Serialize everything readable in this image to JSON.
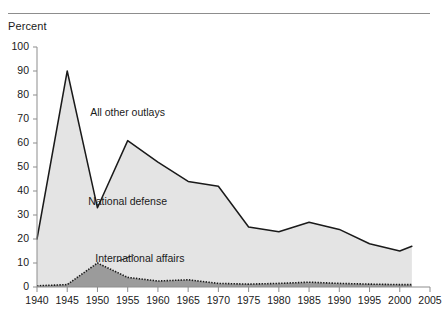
{
  "figure": {
    "y_axis_title": "Percent",
    "partial_top_caption": "",
    "colors": {
      "all_other_fill": "#e4e4e4",
      "international_fill": "#9b9b9b",
      "line": "#1a1a1a",
      "axis": "#8d8d8d",
      "text": "#1a1a1a"
    }
  },
  "chart_data": {
    "type": "area",
    "title": "",
    "subtitle": "",
    "xlabel": "",
    "ylabel": "Percent",
    "xlim": [
      1940,
      2005
    ],
    "ylim": [
      0,
      100
    ],
    "grid": false,
    "legend_position": "inline-annotations",
    "x_ticks": [
      1940,
      1945,
      1950,
      1955,
      1960,
      1965,
      1970,
      1975,
      1980,
      1985,
      1990,
      1995,
      2000,
      2005
    ],
    "y_ticks": [
      0,
      10,
      20,
      30,
      40,
      50,
      60,
      70,
      80,
      90,
      100
    ],
    "annotations": [
      {
        "text": "All other outlays",
        "x": 1955,
        "y": 73
      },
      {
        "text": "National defense",
        "x": 1955,
        "y": 36
      },
      {
        "text": "International affairs",
        "x": 1957,
        "y": 12
      }
    ],
    "x": [
      1940,
      1945,
      1950,
      1955,
      1960,
      1965,
      1970,
      1975,
      1980,
      1985,
      1990,
      1995,
      2000,
      2002
    ],
    "series": [
      {
        "name": "All other outlays",
        "note": "upper boundary = total federal outlays as percent",
        "values": [
          20,
          90,
          33,
          61,
          52,
          44,
          42,
          25,
          23,
          27,
          24,
          18,
          15,
          17
        ]
      },
      {
        "name": "International affairs",
        "note": "lower shaded band, dotted boundary",
        "values": [
          0.5,
          1,
          10,
          4,
          2.5,
          3,
          1.5,
          1.2,
          1.5,
          2,
          1.5,
          1.2,
          1,
          1
        ]
      }
    ]
  }
}
